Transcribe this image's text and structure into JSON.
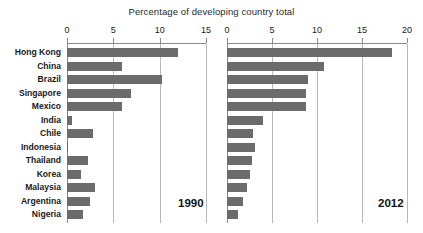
{
  "chart_data": {
    "type": "bar",
    "title": "Percentage of developing country total",
    "xlabel": "Percentage of developing country total",
    "ylabel": "",
    "orientation": "horizontal",
    "grid": true,
    "legend_position": "none",
    "bar_color": "#6b6b6b",
    "categories": [
      "Hong Kong",
      "China",
      "Brazil",
      "Singapore",
      "Mexico",
      "India",
      "Chile",
      "Indonesia",
      "Thailand",
      "Korea",
      "Malaysia",
      "Argentina",
      "Nigeria"
    ],
    "panels": [
      {
        "name": "1990",
        "year_label": "1990",
        "xlim": [
          0,
          15
        ],
        "xticks": [
          0,
          5,
          10,
          15
        ],
        "xtick_labels": [
          "0",
          "5",
          "10",
          "15"
        ],
        "values": [
          12.0,
          5.9,
          10.2,
          6.9,
          5.9,
          0.5,
          2.8,
          0.1,
          2.3,
          1.5,
          3.0,
          2.5,
          1.7
        ]
      },
      {
        "name": "2012",
        "year_label": "2012",
        "xlim": [
          0,
          20
        ],
        "xticks": [
          0,
          5,
          10,
          15,
          20
        ],
        "xtick_labels": [
          "0",
          "5",
          "10",
          "15",
          "20"
        ],
        "values": [
          18.3,
          10.8,
          9.0,
          8.8,
          8.8,
          4.0,
          2.9,
          3.1,
          2.8,
          2.6,
          2.2,
          1.8,
          1.2
        ]
      }
    ],
    "series": [
      {
        "name": "1990",
        "values": [
          12.0,
          5.9,
          10.2,
          6.9,
          5.9,
          0.5,
          2.8,
          0.1,
          2.3,
          1.5,
          3.0,
          2.5,
          1.7
        ]
      },
      {
        "name": "2012",
        "values": [
          18.3,
          10.8,
          9.0,
          8.8,
          8.8,
          4.0,
          2.9,
          3.1,
          2.8,
          2.6,
          2.2,
          1.8,
          1.2
        ]
      }
    ]
  }
}
